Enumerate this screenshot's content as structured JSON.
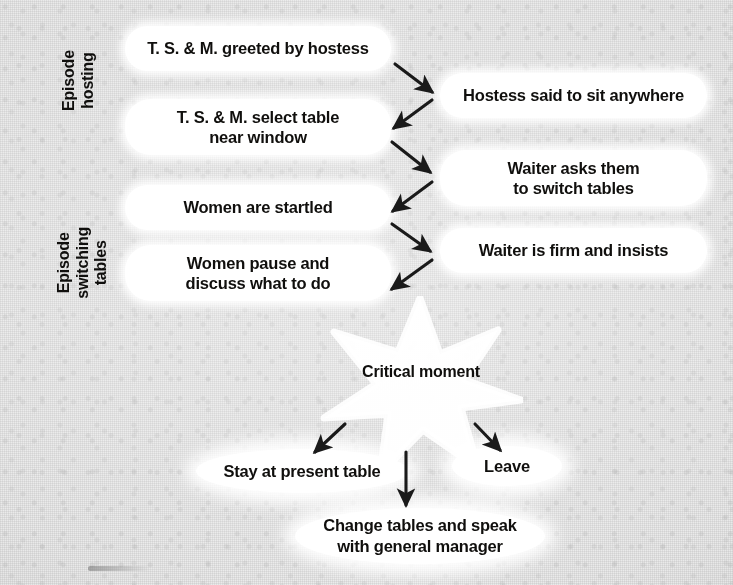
{
  "diagram": {
    "background_color": "#eaeaea",
    "node_color": "#ffffff",
    "text_color": "#100f0d",
    "arrow_color": "#1a1a1a"
  },
  "episode_labels": [
    {
      "id": "episode-hosting",
      "lines": [
        "Episode",
        "hosting"
      ]
    },
    {
      "id": "episode-switching-tables",
      "lines": [
        "Episode",
        "switching",
        "tables"
      ]
    }
  ],
  "left_nodes": [
    {
      "id": "ts-m-greeted",
      "lines": [
        "T. S. & M. greeted by hostess"
      ]
    },
    {
      "id": "ts-m-select-table",
      "lines": [
        "T. S. & M. select table",
        "near window"
      ]
    },
    {
      "id": "women-startled",
      "lines": [
        "Women are startled"
      ]
    },
    {
      "id": "women-pause-discuss",
      "lines": [
        "Women pause and",
        "discuss what to do"
      ]
    }
  ],
  "right_nodes": [
    {
      "id": "hostess-sit-anywhere",
      "lines": [
        "Hostess said to sit anywhere"
      ]
    },
    {
      "id": "waiter-asks-switch",
      "lines": [
        "Waiter asks them",
        "to switch tables"
      ]
    },
    {
      "id": "waiter-firm-insists",
      "lines": [
        "Waiter is firm and insists"
      ]
    }
  ],
  "critical_moment": {
    "label": "Critical moment",
    "star_points": 7
  },
  "outcomes": [
    {
      "id": "stay-at-present-table",
      "lines": [
        "Stay at present table"
      ]
    },
    {
      "id": "change-tables-speak-manager",
      "lines": [
        "Change tables and speak",
        "with general manager"
      ]
    },
    {
      "id": "leave",
      "lines": [
        "Leave"
      ]
    }
  ]
}
